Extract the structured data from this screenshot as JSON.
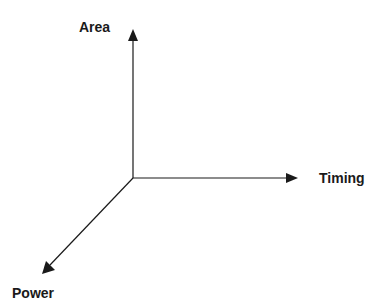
{
  "diagram": {
    "type": "3d-axes",
    "axes": [
      {
        "id": "area",
        "label": "Area",
        "direction": "up"
      },
      {
        "id": "timing",
        "label": "Timing",
        "direction": "right"
      },
      {
        "id": "power",
        "label": "Power",
        "direction": "down-left"
      }
    ],
    "colors": {
      "line": "#1a1a1a",
      "background": "#ffffff"
    }
  }
}
